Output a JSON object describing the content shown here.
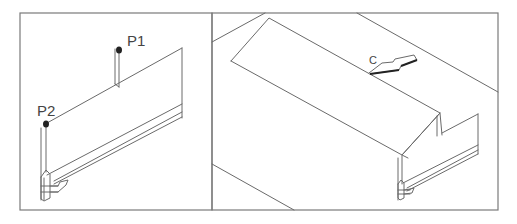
{
  "figure": {
    "panels": [
      {
        "id": "left",
        "description": "Isometric view of a panel with a vertical support; two marked points",
        "labels": [
          {
            "text": "P1"
          },
          {
            "text": "P2"
          }
        ]
      },
      {
        "id": "right",
        "description": "Isometric view of a sloped board placed on the panel with a direction arrow",
        "labels": [
          {
            "text": "C"
          }
        ]
      }
    ],
    "colors": {
      "line": "#6a6a6a",
      "frame": "#7a7a7a",
      "point": "#222222",
      "background": "#ffffff"
    }
  }
}
